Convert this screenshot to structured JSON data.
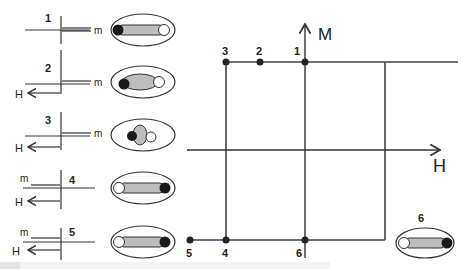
{
  "figure": {
    "type": "magnetic hysteresis loop schematic (M vs H) with molecular alignment states",
    "axes": {
      "x_label": "H",
      "y_label": "M"
    },
    "loop_points": [
      {
        "id": "1",
        "label": "1"
      },
      {
        "id": "2",
        "label": "2"
      },
      {
        "id": "3",
        "label": "3"
      },
      {
        "id": "4",
        "label": "4"
      },
      {
        "id": "5",
        "label": "5"
      },
      {
        "id": "6",
        "label": "6"
      }
    ],
    "states": [
      {
        "label": "1",
        "m_label": "m",
        "h_label": "",
        "molecule": "rod-dark-left"
      },
      {
        "label": "2",
        "m_label": "m",
        "h_label": "H",
        "molecule": "rod-bent-dark-left"
      },
      {
        "label": "3",
        "m_label": "m",
        "h_label": "H",
        "molecule": "cluster"
      },
      {
        "label": "4",
        "m_label": "m",
        "h_label": "H",
        "molecule": "rod-dark-right"
      },
      {
        "label": "5",
        "m_label": "m",
        "h_label": "H",
        "molecule": "rod-dark-right"
      }
    ],
    "inset": {
      "label": "6",
      "molecule": "rod-dark-right"
    },
    "colors": {
      "line": "#333333",
      "rod_fill": "#bdbdbd",
      "dark_atom": "#1a1a1a",
      "light_atom": "#ffffff"
    }
  }
}
